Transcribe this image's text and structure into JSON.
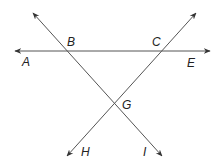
{
  "diagram": {
    "title": "",
    "stroke_color": "#555555",
    "label_color": "#222222",
    "lines": [
      {
        "name": "line-AE",
        "x1": 15,
        "y1": 51,
        "x2": 210,
        "y2": 51,
        "arrows": "both"
      },
      {
        "name": "line-BI",
        "x1": 33,
        "y1": 13,
        "x2": 162,
        "y2": 156,
        "arrows": "both"
      },
      {
        "name": "line-HC",
        "x1": 67,
        "y1": 156,
        "x2": 196,
        "y2": 13,
        "arrows": "both"
      }
    ],
    "points": {
      "A": {
        "label": "A",
        "x": 22,
        "y": 66
      },
      "B": {
        "label": "B",
        "x": 67,
        "y": 46
      },
      "C": {
        "label": "C",
        "x": 152,
        "y": 46
      },
      "E": {
        "label": "E",
        "x": 187,
        "y": 67
      },
      "G": {
        "label": "G",
        "x": 122,
        "y": 109
      },
      "H": {
        "label": "H",
        "x": 81,
        "y": 156
      },
      "I": {
        "label": "I",
        "x": 143,
        "y": 156
      }
    }
  }
}
